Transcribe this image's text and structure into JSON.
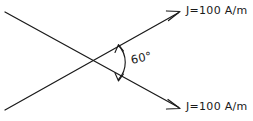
{
  "figure": {
    "name": "crossing-current-sheets-diagram",
    "background_color": "#ffffff",
    "ink_color": "#1a1a1a",
    "width": 253,
    "height": 121,
    "labels": {
      "top_current": {
        "symbol": "J",
        "equals": "=",
        "value": "100",
        "unit": "A/m",
        "full": "J=100 A/m"
      },
      "bottom_current": {
        "symbol": "J",
        "equals": "=",
        "value": "100",
        "unit": "A/m",
        "full": "J=100 A/m"
      },
      "angle": {
        "value": "60",
        "degree_symbol": "°",
        "full": "60°"
      }
    },
    "elements": {
      "ascending_line_name": "ascending-current-line",
      "descending_line_name": "descending-current-line",
      "angle_arc_name": "angle-arc-double-arrow"
    }
  }
}
